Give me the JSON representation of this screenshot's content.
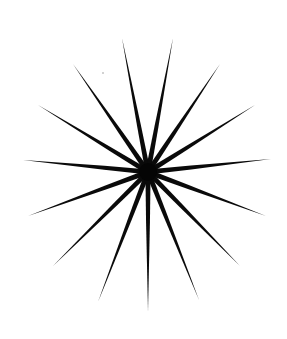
{
  "image": {
    "width": 287,
    "height": 339,
    "background": "#ffffff"
  },
  "starburst": {
    "label": "starburst",
    "color": "#0a0a0a",
    "center": [
      148,
      172
    ],
    "hub_radius": 9,
    "base_half_width": 2.6,
    "ray_count": 15,
    "ray_tips": [
      [
        122,
        38
      ],
      [
        173,
        38
      ],
      [
        73,
        64
      ],
      [
        220,
        64
      ],
      [
        38,
        105
      ],
      [
        255,
        105
      ],
      [
        23,
        160
      ],
      [
        271,
        159
      ],
      [
        28,
        216
      ],
      [
        266,
        216
      ],
      [
        53,
        266
      ],
      [
        240,
        266
      ],
      [
        98,
        302
      ],
      [
        199,
        300
      ],
      [
        148,
        312
      ]
    ]
  },
  "specks": [
    [
      103,
      73
    ]
  ]
}
